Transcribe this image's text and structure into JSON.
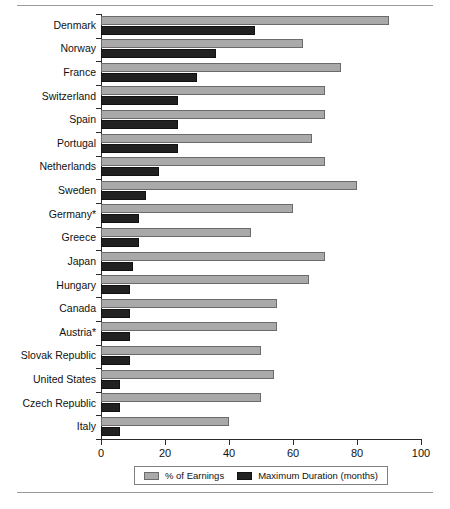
{
  "chart_data": {
    "type": "bar",
    "orientation": "horizontal",
    "title": "",
    "xlabel": "",
    "ylabel": "",
    "xlim": [
      0,
      100
    ],
    "xticks": [
      0,
      20,
      40,
      60,
      80,
      100
    ],
    "grid": false,
    "legend_position": "bottom",
    "categories": [
      "Denmark",
      "Norway",
      "France",
      "Switzerland",
      "Spain",
      "Portugal",
      "Netherlands",
      "Sweden",
      "Germany*",
      "Greece",
      "Japan",
      "Hungary",
      "Canada",
      "Austria*",
      "Slovak Republic",
      "United States",
      "Czech Republic",
      "Italy"
    ],
    "series": [
      {
        "name": "% of Earnings",
        "color": "#a9a9a9",
        "values": [
          90,
          63,
          75,
          70,
          70,
          66,
          70,
          80,
          60,
          47,
          70,
          65,
          55,
          55,
          50,
          54,
          50,
          40
        ]
      },
      {
        "name": "Maximum Duration (months)",
        "color": "#212121",
        "values": [
          48,
          36,
          30,
          24,
          24,
          24,
          18,
          14,
          12,
          12,
          10,
          9,
          9,
          9,
          9,
          6,
          6,
          6
        ]
      }
    ]
  },
  "legend": {
    "items": [
      {
        "label": "% of Earnings",
        "swatch": "pct"
      },
      {
        "label": "Maximum Duration (months)",
        "swatch": "dur"
      }
    ]
  },
  "caption": {
    "text": ""
  }
}
